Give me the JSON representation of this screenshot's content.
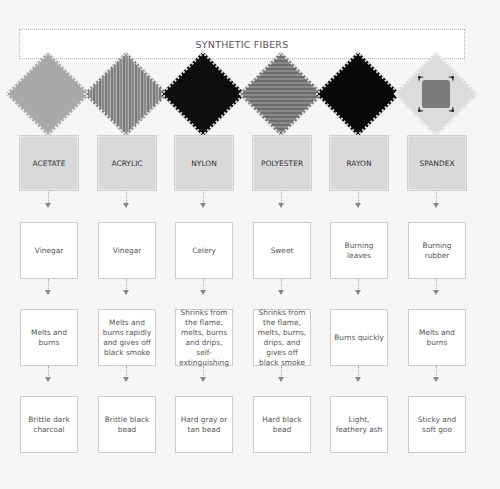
{
  "header": {
    "title": "SYNTHETIC FIBERS"
  },
  "rows": [
    "fiber",
    "smell",
    "burn_behavior",
    "residue"
  ],
  "fibers": [
    {
      "name": "ACETATE",
      "swatch": "light-gray-fabric",
      "smell": "Vinegar",
      "burn": "Melts and burns",
      "residue": "Brittle dark charcoal"
    },
    {
      "name": "ACRYLIC",
      "swatch": "textured-gray-fabric",
      "smell": "Vinegar",
      "burn": "Melts and burns rapidly and gives off black smoke",
      "residue": "Brittle black bead"
    },
    {
      "name": "NYLON",
      "swatch": "black-fabric",
      "smell": "Celery",
      "burn": "Shrinks from the flame, melts, burns and drips, self-extinguishing",
      "residue": "Hard gray or tan bead"
    },
    {
      "name": "POLYESTER",
      "swatch": "dark-gray-fabric",
      "smell": "Sweet",
      "burn": "Shrinks from the flame, melts, burns, drips, and gives off black smoke",
      "residue": "Hard black bead"
    },
    {
      "name": "RAYON",
      "swatch": "black-fabric",
      "smell": "Burning leaves",
      "burn": "Burns quickly",
      "residue": "Light, feathery ash"
    },
    {
      "name": "SPANDEX",
      "swatch": "stretched-white-fabric",
      "smell": "Burning rubber",
      "burn": "Melts and burns",
      "residue": "Sticky and soft goo"
    }
  ],
  "colors": {
    "background": "#f6f6f6",
    "label_box": "#d9d9d9",
    "arrow": "#888888",
    "box_border": "#cccccc"
  }
}
